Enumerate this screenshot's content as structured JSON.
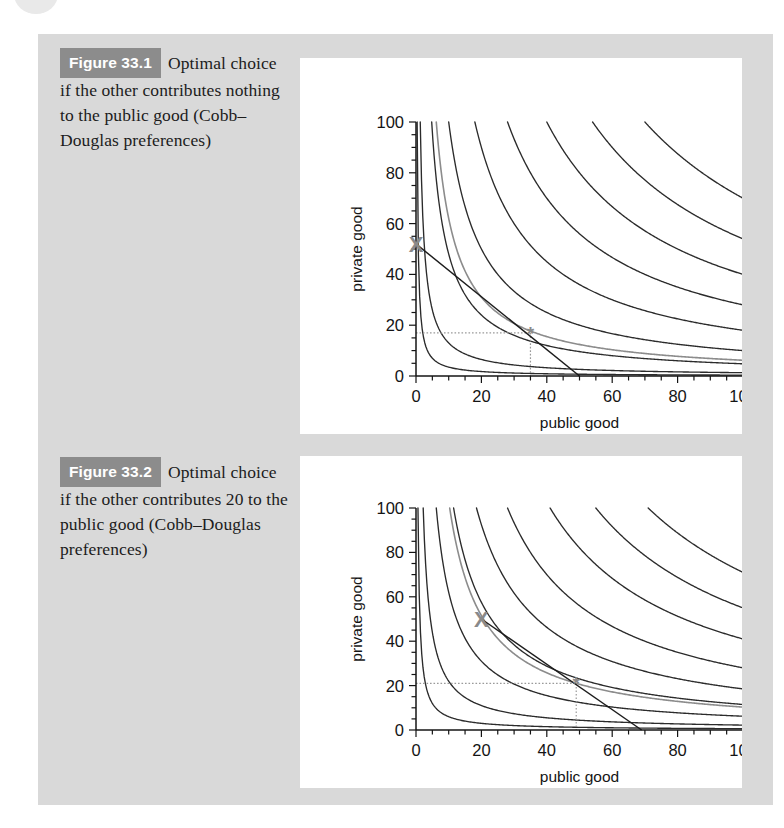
{
  "page": {
    "background_color": "#d9d9d9",
    "panel_color": "#ffffff"
  },
  "figures": [
    {
      "badge": "Figure 33.1",
      "caption": "Optimal choice if the other contributes nothing to the public good (Cobb–Douglas preferences)",
      "chart_data": {
        "type": "line",
        "title": "",
        "xlabel": "public good",
        "ylabel": "private good",
        "xlim": [
          0,
          100
        ],
        "ylim": [
          0,
          100
        ],
        "xticks": [
          0,
          20,
          40,
          60,
          80,
          100
        ],
        "yticks": [
          0,
          20,
          40,
          60,
          80,
          100
        ],
        "minor_tick_step": 5,
        "grid": false,
        "legend": null,
        "curve_family": "Cobb–Douglas indifference curves: private = k / public",
        "curve_color": "#2b2b2b",
        "highlight_curve_color": "#8c8c8c",
        "series": [
          {
            "name": "indifference-curve-1",
            "k": 35,
            "color": "#2b2b2b"
          },
          {
            "name": "indifference-curve-2",
            "k": 130,
            "color": "#2b2b2b"
          },
          {
            "name": "indifference-curve-3",
            "k": 480,
            "color": "#2b2b2b"
          },
          {
            "name": "indifference-curve-opt",
            "k": 620,
            "color": "#8c8c8c"
          },
          {
            "name": "indifference-curve-4",
            "k": 1000,
            "color": "#2b2b2b"
          },
          {
            "name": "indifference-curve-5",
            "k": 1800,
            "color": "#2b2b2b"
          },
          {
            "name": "indifference-curve-6",
            "k": 2800,
            "color": "#2b2b2b"
          },
          {
            "name": "indifference-curve-7",
            "k": 4000,
            "color": "#2b2b2b"
          },
          {
            "name": "indifference-curve-8",
            "k": 5400,
            "color": "#2b2b2b"
          },
          {
            "name": "indifference-curve-9",
            "k": 7000,
            "color": "#2b2b2b"
          }
        ],
        "budget_line": {
          "name": "budget-line",
          "from": [
            0,
            52
          ],
          "to": [
            50,
            0
          ],
          "color": "#1c1c1c"
        },
        "endowment_marker": {
          "name": "endowment-x-marker",
          "label": "X",
          "x": 0,
          "y": 52,
          "color": "#8a8a8a"
        },
        "optimum_marker": {
          "name": "optimum-star-marker",
          "label": "*",
          "x": 35,
          "y": 17,
          "color": "#8a8a8a"
        },
        "dotted_guides": {
          "color": "#9a9a9a",
          "horizontal_y": 17,
          "vertical_x": 35
        }
      }
    },
    {
      "badge": "Figure 33.2",
      "caption": "Optimal choice if the other contributes 20 to the public good (Cobb–Douglas preferences)",
      "chart_data": {
        "type": "line",
        "title": "",
        "xlabel": "public good",
        "ylabel": "private good",
        "xlim": [
          0,
          100
        ],
        "ylim": [
          0,
          100
        ],
        "xticks": [
          0,
          20,
          40,
          60,
          80,
          100
        ],
        "yticks": [
          0,
          20,
          40,
          60,
          80,
          100
        ],
        "minor_tick_step": 5,
        "grid": false,
        "legend": null,
        "curve_family": "Cobb–Douglas indifference curves: private = k / public",
        "curve_color": "#2b2b2b",
        "highlight_curve_color": "#8c8c8c",
        "series": [
          {
            "name": "indifference-curve-1",
            "k": 60,
            "color": "#2b2b2b"
          },
          {
            "name": "indifference-curve-2",
            "k": 220,
            "color": "#2b2b2b"
          },
          {
            "name": "indifference-curve-3",
            "k": 620,
            "color": "#2b2b2b"
          },
          {
            "name": "indifference-curve-opt",
            "k": 1030,
            "color": "#8c8c8c"
          },
          {
            "name": "indifference-curve-4",
            "k": 1150,
            "color": "#2b2b2b"
          },
          {
            "name": "indifference-curve-5",
            "k": 1850,
            "color": "#2b2b2b"
          },
          {
            "name": "indifference-curve-6",
            "k": 2800,
            "color": "#2b2b2b"
          },
          {
            "name": "indifference-curve-7",
            "k": 4100,
            "color": "#2b2b2b"
          },
          {
            "name": "indifference-curve-8",
            "k": 5500,
            "color": "#2b2b2b"
          },
          {
            "name": "indifference-curve-9",
            "k": 7100,
            "color": "#2b2b2b"
          }
        ],
        "budget_line": {
          "name": "budget-line",
          "from": [
            20,
            50
          ],
          "to": [
            69,
            0
          ],
          "color": "#1c1c1c"
        },
        "endowment_marker": {
          "name": "endowment-x-marker",
          "label": "X",
          "x": 20,
          "y": 50,
          "color": "#8a8a8a"
        },
        "optimum_marker": {
          "name": "optimum-star-marker",
          "label": "*",
          "x": 49,
          "y": 21,
          "color": "#8a8a8a"
        },
        "dotted_guides": {
          "color": "#9a9a9a",
          "horizontal_y": 21,
          "vertical_x": 49
        }
      }
    }
  ]
}
